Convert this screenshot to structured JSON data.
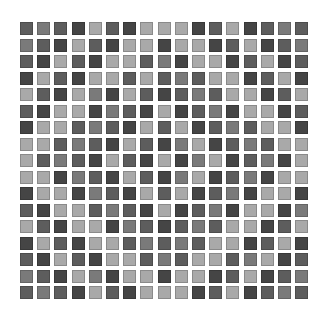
{
  "grid": {
    "rows": 17,
    "cols": 17,
    "origin_x": 20,
    "origin_y": 22,
    "pitch_x": 17.2,
    "pitch_y": 16.5,
    "cell_size": 13,
    "palette": {
      "A": "#454545",
      "B": "#5d5d5d",
      "C": "#7a7a7a",
      "D": "#a9a9a9"
    },
    "cells": [
      "BCBADBADDDABDABCB",
      "CBADBADDADDABDABC",
      "BADBADDBCADDABDAB",
      "ADBADDBDBCBDDABDA",
      "DBADCADBABCBDDABD",
      "BADDACBADABCADDAB",
      "ADDBCBADBDABCBDDA",
      "DDBCBADBACDABCBDD",
      "DBCBADBADACDABCAD",
      "DDACBADBACDABCADD",
      "ADDACBADBDABCADDA",
      "BADDBCBADABCADDAC",
      "DBADDACBABCBDDABD",
      "ADBADDBCBCBDDABDA",
      "BADBADDBCBDDBCDAB",
      "CBADCADDADDABDABC",
      "BCBADBADDDABDABCB"
    ]
  }
}
